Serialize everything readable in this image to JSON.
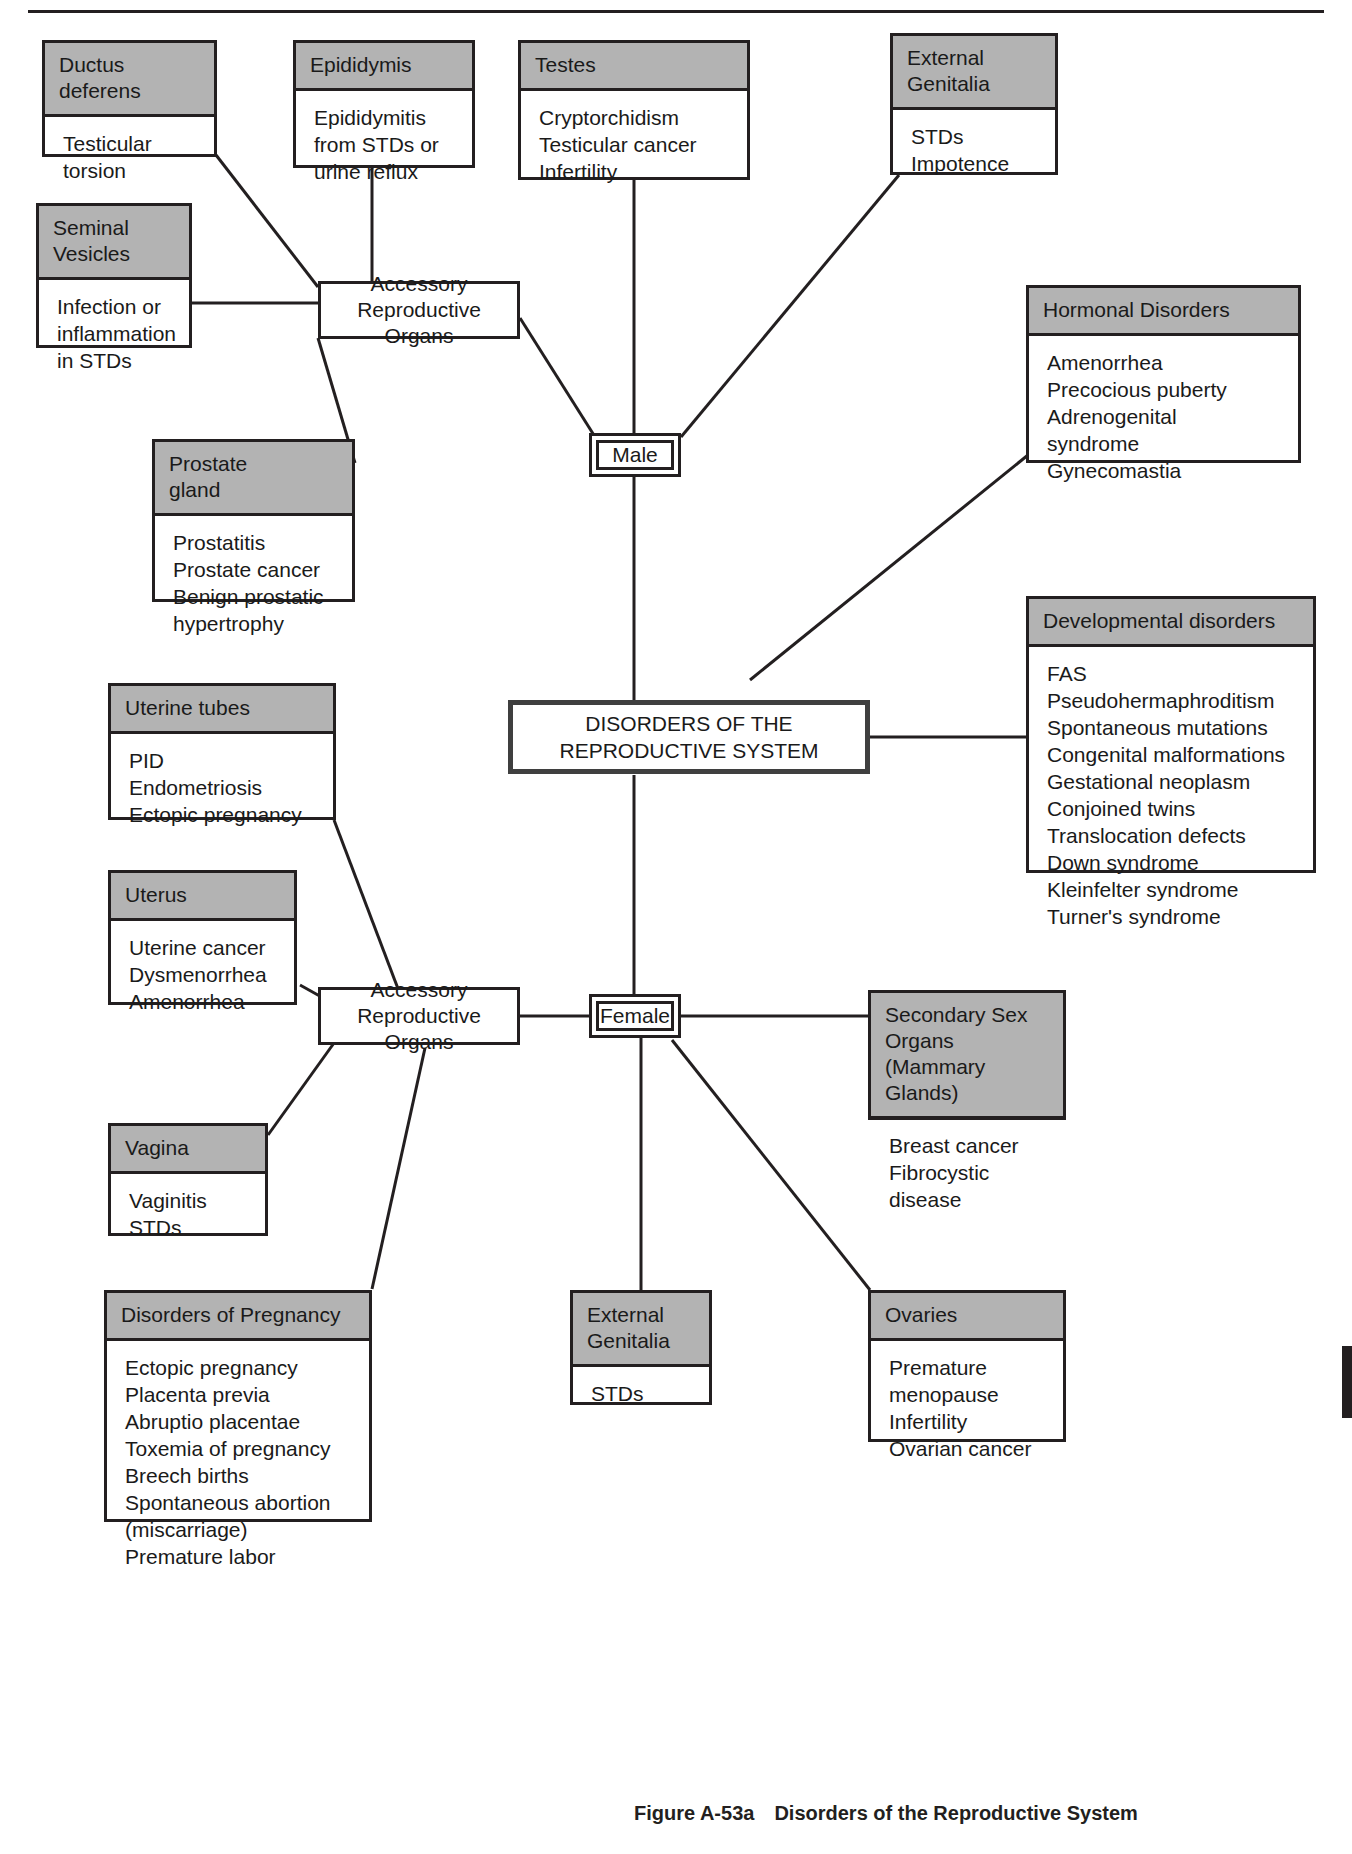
{
  "figure": {
    "number": "Figure A-53a",
    "title": "Disorders of the Reproductive System"
  },
  "hub": {
    "label": "DISORDERS OF THE\nREPRODUCTIVE SYSTEM"
  },
  "branches": {
    "male": "Male",
    "female": "Female"
  },
  "nodes": {
    "male_accessory": "Accessory\nReproductive Organs",
    "female_accessory": "Accessory\nReproductive Organs"
  },
  "cards": {
    "ductus_deferens": {
      "title": "Ductus deferens",
      "items": "Testicular\n   torsion"
    },
    "epididymis": {
      "title": "Epididymis",
      "items": "Epididymitis\n   from STDs or\n   urine reflux"
    },
    "testes": {
      "title": "Testes",
      "items": "Cryptorchidism\nTesticular cancer\nInfertility"
    },
    "external_genitalia_male": {
      "title": "External\nGenitalia",
      "items": "STDs\nImpotence"
    },
    "seminal_vesicles": {
      "title": "Seminal\nVesicles",
      "items": "Infection or\n   inflammation\n   in STDs"
    },
    "prostate_gland": {
      "title": "Prostate\ngland",
      "items": "Prostatitis\nProstate cancer\nBenign prostatic\n   hypertrophy"
    },
    "hormonal_disorders": {
      "title": "Hormonal Disorders",
      "items": "Amenorrhea\nPrecocious puberty\nAdrenogenital\n   syndrome\nGynecomastia"
    },
    "developmental_disorders": {
      "title": "Developmental disorders",
      "items": "FAS\nPseudohermaphroditism\nSpontaneous mutations\nCongenital malformations\nGestational neoplasm\nConjoined twins\nTranslocation defects\nDown syndrome\nKleinfelter syndrome\nTurner's syndrome"
    },
    "uterine_tubes": {
      "title": "Uterine tubes",
      "items": "PID\nEndometriosis\nEctopic pregnancy"
    },
    "uterus": {
      "title": "Uterus",
      "items": "Uterine cancer\nDysmenorrhea\nAmenorrhea"
    },
    "vagina": {
      "title": "Vagina",
      "items": "Vaginitis\nSTDs"
    },
    "disorders_of_pregnancy": {
      "title": "Disorders of Pregnancy",
      "items": "Ectopic pregnancy\nPlacenta previa\nAbruptio placentae\nToxemia of pregnancy\nBreech births\nSpontaneous abortion\n   (miscarriage)\nPremature labor"
    },
    "external_genitalia_female": {
      "title": "External\nGenitalia",
      "items": "STDs"
    },
    "ovaries": {
      "title": "Ovaries",
      "items": "Premature\n   menopause\nInfertility\nOvarian cancer"
    },
    "secondary_sex_organs": {
      "title": "Secondary Sex Organs\n(Mammary Glands)",
      "items": "Breast cancer\nFibrocystic disease"
    }
  },
  "colors": {
    "header_fill": "#b3b3b3",
    "line": "#231f20",
    "background": "#ffffff"
  }
}
